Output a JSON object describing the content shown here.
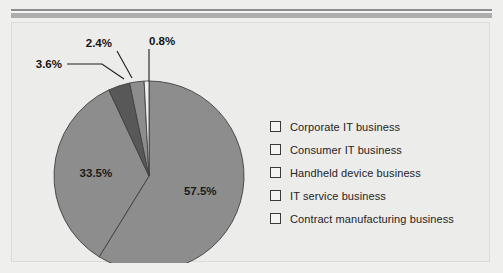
{
  "chart_data": {
    "type": "pie",
    "title": "",
    "subtitle": "",
    "xlabel": "",
    "ylabel": "",
    "legend_position": "right",
    "grid": false,
    "units": "percent",
    "categories": [
      "Corporate IT business",
      "Consumer IT business",
      "Handheld device business",
      "IT service business",
      "Contract manufacturing business"
    ],
    "values": [
      57.5,
      33.5,
      3.6,
      2.4,
      0.8
    ],
    "slices": [
      {
        "label": "57.5%",
        "value": 57.5,
        "category": "Corporate IT business",
        "color": "#8d8d8d",
        "label_placement": "inside"
      },
      {
        "label": "33.5%",
        "value": 33.5,
        "category": "Consumer IT business",
        "color": "#8d8d8d",
        "label_placement": "inside"
      },
      {
        "label": "3.6%",
        "value": 3.6,
        "category": "Handheld device business",
        "color": "#585858",
        "label_placement": "callout"
      },
      {
        "label": "2.4%",
        "value": 2.4,
        "category": "IT service business",
        "color": "#8d8d8d",
        "label_placement": "callout"
      },
      {
        "label": "0.8%",
        "value": 0.8,
        "category": "Contract manufacturing business",
        "color": "#efefee",
        "label_placement": "callout"
      }
    ]
  },
  "legend": {
    "items": [
      {
        "label": "Corporate IT business"
      },
      {
        "label": "Consumer IT business"
      },
      {
        "label": "Handheld device business"
      },
      {
        "label": "IT service business"
      },
      {
        "label": "Contract manufacturing business"
      }
    ]
  },
  "colors": {
    "page_background": "#efefee",
    "panel_background": "#ececeb",
    "slice_light": "#8d8d8d",
    "slice_dark": "#585858",
    "slice_white": "#efefee",
    "outline": "#3a3a3a",
    "text": "#242424",
    "rule_dark": "#8d8d8d",
    "rule_gray": "#adadad"
  }
}
